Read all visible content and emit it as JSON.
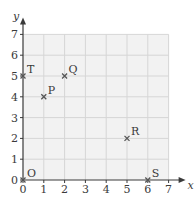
{
  "chart_data": {
    "type": "scatter",
    "title": "",
    "xlabel": "x",
    "ylabel": "y",
    "xlim": [
      0,
      7
    ],
    "ylim": [
      0,
      7
    ],
    "grid": true,
    "x_ticks": [
      "0",
      "1",
      "2",
      "3",
      "4",
      "5",
      "6",
      "7"
    ],
    "y_ticks": [
      "0",
      "1",
      "2",
      "3",
      "4",
      "5",
      "6",
      "7"
    ],
    "points": [
      {
        "label": "O",
        "x": 0,
        "y": 0
      },
      {
        "label": "P",
        "x": 1,
        "y": 4
      },
      {
        "label": "Q",
        "x": 2,
        "y": 5
      },
      {
        "label": "R",
        "x": 5,
        "y": 2
      },
      {
        "label": "S",
        "x": 6,
        "y": 0
      },
      {
        "label": "T",
        "x": 0,
        "y": 5
      }
    ],
    "marker": "x"
  },
  "colors": {
    "grid_fill": "#f2f2f2",
    "grid_line": "#d6d6d6",
    "axis": "#3a3a3a",
    "marker": "#555555"
  }
}
